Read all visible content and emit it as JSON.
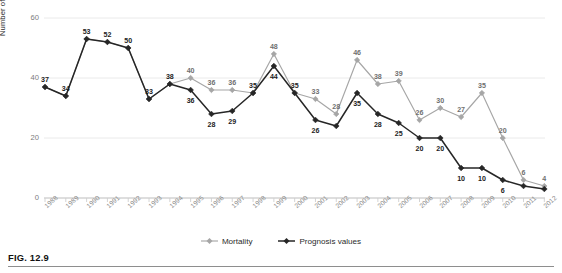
{
  "figure": {
    "caption": "FIG. 12.9"
  },
  "legend": {
    "position": "bottom-center",
    "items": [
      {
        "label": "Mortality",
        "color": "#a6a6a6",
        "marker": "diamond-point"
      },
      {
        "label": "Prognosis values",
        "color": "#262626",
        "marker": "diamond-point"
      }
    ]
  },
  "chart_data": {
    "type": "line",
    "title": "",
    "subtitle": "",
    "xlabel": "",
    "ylabel": "Number of diagnosed cases",
    "ylim": [
      0,
      60
    ],
    "yticks": [
      0,
      20,
      40,
      60
    ],
    "grid": true,
    "grid_axis": "y",
    "legend": "bottom-center",
    "categories": [
      "1988",
      "1989",
      "1990",
      "1991",
      "1992",
      "1993",
      "1994",
      "1995",
      "1996",
      "1997",
      "1998",
      "1999",
      "2000",
      "2001",
      "2002",
      "2003",
      "2004",
      "2005",
      "2006",
      "2007",
      "2008",
      "2009",
      "2010",
      "2011",
      "2012"
    ],
    "series": [
      {
        "name": "Mortality",
        "color": "#a6a6a6",
        "values": [
          37,
          34,
          53,
          52,
          50,
          33,
          38,
          40,
          36,
          36,
          35,
          48,
          35,
          33,
          28,
          46,
          38,
          39,
          26,
          30,
          27,
          35,
          20,
          6,
          4
        ],
        "labels": [
          "37",
          "34",
          "53",
          "52",
          "50",
          "33",
          "38",
          "40",
          "36",
          "36",
          "35",
          "48",
          "35",
          "33",
          "28",
          "46",
          "38",
          "39",
          "26",
          "30",
          "27",
          "35",
          "20",
          "6",
          "4"
        ]
      },
      {
        "name": "Prognosis values",
        "color": "#262626",
        "values": [
          37,
          34,
          53,
          52,
          50,
          33,
          38,
          36,
          28,
          29,
          35,
          44,
          35,
          26,
          24,
          35,
          28,
          25,
          20,
          20,
          10,
          10,
          6,
          4,
          3
        ],
        "labels": [
          "37",
          "34",
          "53",
          "52",
          "50",
          "33",
          "38",
          "36",
          "28",
          "29",
          "35",
          "44",
          "35",
          "26",
          "",
          "35",
          "28",
          "25",
          "20",
          "20",
          "10",
          "10",
          "6",
          "",
          ""
        ]
      }
    ]
  }
}
